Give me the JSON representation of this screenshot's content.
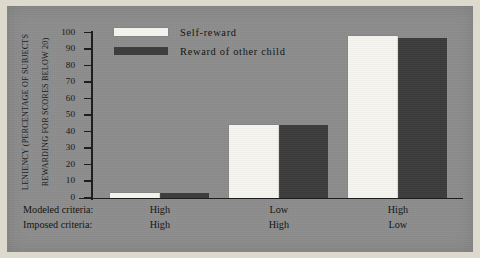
{
  "chart_data": {
    "type": "bar",
    "title": "",
    "subtitle": "",
    "xlabel": "",
    "ylabel": "LENIENCY (PERCENTAGE OF SUBJECTS REWARDING FOR SCORES BELOW 20)",
    "ylabel_lines": [
      "LENIENCY (PERCENTAGE OF SUBJECTS",
      "REWARDING FOR SCORES BELOW 20)"
    ],
    "ylim": [
      0,
      100
    ],
    "ytick_step": 10,
    "yticks": [
      100,
      90,
      80,
      70,
      60,
      50,
      40,
      30,
      20,
      10,
      0
    ],
    "grid": false,
    "legend_position": "top-left-inside",
    "categories": [
      "High / High",
      "Low / High",
      "High / Low"
    ],
    "group_axis_rows": [
      {
        "name": "Modeled criteria:",
        "values": [
          "High",
          "Low",
          "High"
        ]
      },
      {
        "name": "Imposed criteria:",
        "values": [
          "High",
          "High",
          "Low"
        ]
      }
    ],
    "series": [
      {
        "name": "Self-reward",
        "color": "#f7f5f0",
        "values": [
          3,
          44,
          98
        ]
      },
      {
        "name": "Reward of other child",
        "color": "#3b3b3b",
        "values": [
          3,
          44,
          97
        ]
      }
    ]
  },
  "legend": {
    "items": [
      {
        "label": "Self-reward",
        "color": "#f7f5f0"
      },
      {
        "label": "Reward of other child",
        "color": "#3b3b3b"
      }
    ]
  },
  "colors": {
    "panel_background": "#8d8d8d",
    "page_background": "#ddd9cd",
    "axis": "#1b1b1b",
    "text": "#111111",
    "series_self_reward": "#f7f5f0",
    "series_other_child": "#3b3b3b"
  }
}
